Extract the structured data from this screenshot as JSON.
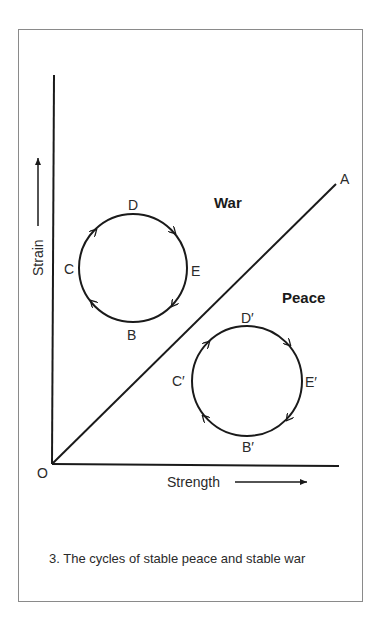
{
  "figure": {
    "number": "3.",
    "caption": "3.  The cycles of stable peace and stable war"
  },
  "axes": {
    "origin_label": "O",
    "x_label": "Strength",
    "y_label": "Strain"
  },
  "boundary_line": {
    "end_label": "A"
  },
  "regions": {
    "upper": "War",
    "lower": "Peace"
  },
  "cycles": {
    "war": {
      "labels": {
        "top": "D",
        "right": "E",
        "bottom": "B",
        "left": "C"
      },
      "direction": "clockwise"
    },
    "peace": {
      "labels": {
        "top": "D′",
        "right": "E′",
        "bottom": "B′",
        "left": "C′"
      },
      "direction": "clockwise"
    }
  },
  "colors": {
    "ink": "#1a1a1a",
    "frame": "#8a8a8a",
    "background": "#ffffff"
  }
}
